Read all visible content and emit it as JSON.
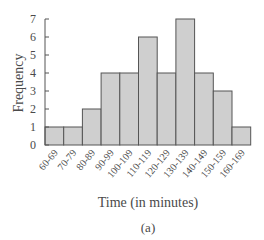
{
  "chart_data": {
    "type": "bar",
    "title": "",
    "xlabel": "Time (in minutes)",
    "ylabel": "Frequency",
    "caption": "(a)",
    "categories": [
      "60-69",
      "70-79",
      "80-89",
      "90-99",
      "100-109",
      "110-119",
      "120-129",
      "130-139",
      "140-149",
      "150-159",
      "160-169"
    ],
    "values": [
      1,
      1,
      2,
      4,
      4,
      6,
      4,
      7,
      4,
      3,
      1
    ],
    "yticks": [
      0,
      1,
      2,
      3,
      4,
      5,
      6,
      7
    ],
    "ylim": [
      0,
      7
    ],
    "grid": false,
    "legend": null,
    "bar_color": "#cfcfcf",
    "bar_edge_color": "#555555"
  }
}
